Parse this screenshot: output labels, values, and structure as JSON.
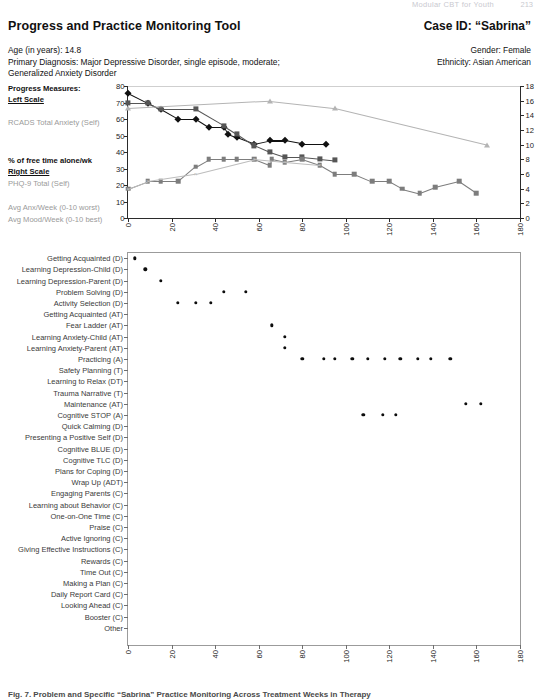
{
  "running_header": {
    "text": "Modular CBT for Youth",
    "page": "213"
  },
  "header": {
    "title": "Progress and Practice Monitoring Tool",
    "case_id": "Case ID: “Sabrina”",
    "age": "Age (in years): 14.8",
    "diagnosis_line1": "Primary Diagnosis: Major Depressive Disorder, single episode, moderate;",
    "diagnosis_line2": "Generalized Anxiety Disorder",
    "gender": "Gender: Female",
    "ethnicity": "Ethnicity: Asian American"
  },
  "legend": {
    "heading": "Progress Measures:",
    "left_scale": "Left Scale",
    "item_rcads": "RCADS Total Anxiety (Self)",
    "item_freetime": "% of free time alone/wk",
    "right_scale": "Right Scale",
    "item_phq": "PHQ-9 Total (Self)",
    "item_anx": "Avg Anx/Week (0-10 worst)",
    "item_mood": "Avg Mood/Week (0-10 best)"
  },
  "chart_data": [
    {
      "type": "line",
      "id": "progress-measures-chart",
      "title": "",
      "xlabel": "",
      "ylabel": "",
      "xlim": [
        0,
        180
      ],
      "ylim_left": [
        0,
        80
      ],
      "ylim_right": [
        0,
        18
      ],
      "xticks": [
        0,
        20,
        40,
        60,
        80,
        100,
        120,
        140,
        160,
        180
      ],
      "yticks_left": [
        0,
        10,
        20,
        30,
        40,
        50,
        60,
        70,
        80
      ],
      "yticks_right": [
        0,
        2,
        4,
        6,
        8,
        10,
        12,
        14,
        16,
        18
      ],
      "grid": false,
      "legend_position": "left-outside",
      "series": [
        {
          "name": "RCADS Total Anxiety (Self)",
          "axis": "left",
          "marker": "diamond",
          "color": "#111111",
          "points": [
            [
              0,
              76
            ],
            [
              9,
              70
            ],
            [
              15,
              66
            ],
            [
              23,
              60
            ],
            [
              31,
              60
            ],
            [
              37,
              55
            ],
            [
              44,
              55
            ],
            [
              46,
              51
            ],
            [
              50,
              49
            ],
            [
              58,
              45
            ],
            [
              65,
              47
            ],
            [
              72,
              47
            ],
            [
              80,
              45
            ],
            [
              91,
              45
            ]
          ]
        },
        {
          "name": "% of free time alone/wk",
          "axis": "left",
          "marker": "square-dark",
          "color": "#565656",
          "points": [
            [
              0,
              70
            ],
            [
              9,
              70
            ],
            [
              15,
              66
            ],
            [
              31,
              66
            ],
            [
              44,
              56
            ],
            [
              50,
              51
            ],
            [
              58,
              44
            ],
            [
              65,
              40
            ],
            [
              72,
              37
            ],
            [
              80,
              37
            ],
            [
              88,
              36
            ],
            [
              95,
              35
            ]
          ]
        },
        {
          "name": "PHQ-9 Total (Self)",
          "axis": "right",
          "marker": "square",
          "color": "#7d7d7d",
          "points": [
            [
              0,
              4
            ],
            [
              9,
              5
            ],
            [
              15,
              5
            ],
            [
              23,
              5
            ],
            [
              31,
              7
            ],
            [
              37,
              8
            ],
            [
              44,
              8
            ],
            [
              50,
              8
            ],
            [
              58,
              8
            ],
            [
              65,
              7.2
            ],
            [
              66,
              8
            ],
            [
              72,
              7.6
            ],
            [
              80,
              8
            ],
            [
              88,
              7.2
            ],
            [
              95,
              6
            ],
            [
              104,
              6
            ],
            [
              112,
              5
            ],
            [
              120,
              5
            ],
            [
              126,
              4
            ],
            [
              134,
              3.4
            ],
            [
              141,
              4.2
            ],
            [
              152,
              5
            ],
            [
              160,
              3.4
            ]
          ]
        },
        {
          "name": "Avg Anx/Week (0-10 worst)",
          "axis": "right",
          "marker": "triangle",
          "color": "#b4b4b4",
          "points": [
            [
              0,
              15
            ],
            [
              65,
              16
            ],
            [
              95,
              15
            ],
            [
              165,
              10
            ]
          ]
        },
        {
          "name": "Avg Mood/Week (0-10 best)",
          "axis": "right",
          "marker": "cross",
          "color": "#bdbdbd",
          "points": [
            [
              0,
              4
            ],
            [
              9,
              5
            ],
            [
              31,
              6
            ],
            [
              58,
              8
            ],
            [
              72,
              7.6
            ],
            [
              88,
              7.2
            ]
          ]
        }
      ]
    },
    {
      "type": "scatter",
      "id": "practice-timeline-chart",
      "title": "",
      "xlabel": "",
      "ylabel": "",
      "xlim": [
        0,
        180
      ],
      "xticks": [
        0,
        20,
        40,
        60,
        80,
        100,
        120,
        140,
        160,
        180
      ],
      "grid": false,
      "categories": [
        "Getting Acquainted (D)",
        "Learning Depression-Child (D)",
        "Learning Depression-Parent (D)",
        "Problem Solving (D)",
        "Activity Selection (D)",
        "Getting Acquainted (AT)",
        "Fear Ladder (AT)",
        "Learning Anxiety-Child (AT)",
        "Learning Anxiety-Parent (AT)",
        "Practicing (A)",
        "Safety Planning (T)",
        "Learning to Relax (DT)",
        "Trauma Narrative (T)",
        "Maintenance (AT)",
        "Cognitive STOP (A)",
        "Quick Calming (D)",
        "Presenting a Positive Self (D)",
        "Cognitive BLUE (D)",
        "Cognitive TLC (D)",
        "Plans for Coping (D)",
        "Wrap Up (ADT)",
        "Engaging Parents (C)",
        "Learning about Behavior (C)",
        "One-on-One Time (C)",
        "Praise (C)",
        "Active Ignoring (C)",
        "Giving Effective Instructions (C)",
        "Rewards (C)",
        "Time Out (C)",
        "Making a Plan (C)",
        "Daily Report Card (C)",
        "Looking Ahead (C)",
        "Booster (C)",
        "Other"
      ],
      "points": [
        {
          "category": "Getting Acquainted (D)",
          "x": 3
        },
        {
          "category": "Learning Depression-Child (D)",
          "x": 8
        },
        {
          "category": "Learning Depression-Parent (D)",
          "x": 15
        },
        {
          "category": "Problem Solving (D)",
          "x": 44
        },
        {
          "category": "Problem Solving (D)",
          "x": 54
        },
        {
          "category": "Activity Selection (D)",
          "x": 23
        },
        {
          "category": "Activity Selection (D)",
          "x": 31
        },
        {
          "category": "Activity Selection (D)",
          "x": 38
        },
        {
          "category": "Fear Ladder (AT)",
          "x": 66
        },
        {
          "category": "Learning Anxiety-Child (AT)",
          "x": 72
        },
        {
          "category": "Learning Anxiety-Parent (AT)",
          "x": 72
        },
        {
          "category": "Practicing (A)",
          "x": 80
        },
        {
          "category": "Practicing (A)",
          "x": 90
        },
        {
          "category": "Practicing (A)",
          "x": 95
        },
        {
          "category": "Practicing (A)",
          "x": 103
        },
        {
          "category": "Practicing (A)",
          "x": 110
        },
        {
          "category": "Practicing (A)",
          "x": 118
        },
        {
          "category": "Practicing (A)",
          "x": 125
        },
        {
          "category": "Practicing (A)",
          "x": 133
        },
        {
          "category": "Practicing (A)",
          "x": 139
        },
        {
          "category": "Practicing (A)",
          "x": 148
        },
        {
          "category": "Maintenance (AT)",
          "x": 155
        },
        {
          "category": "Maintenance (AT)",
          "x": 162
        },
        {
          "category": "Cognitive STOP (A)",
          "x": 108
        },
        {
          "category": "Cognitive STOP (A)",
          "x": 117
        },
        {
          "category": "Cognitive STOP (A)",
          "x": 123
        }
      ]
    }
  ],
  "caption": "Fig. 7. Problem and Specific “Sabrina” Practice Monitoring Across Treatment Weeks in Therapy"
}
